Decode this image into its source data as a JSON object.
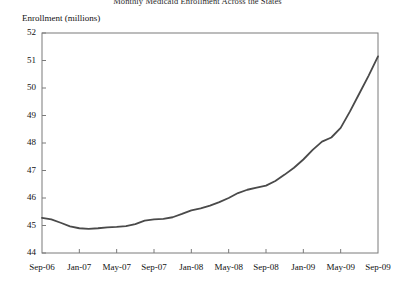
{
  "chart_data": {
    "type": "line",
    "title": "Monthly Medicaid Enrollment Across the States",
    "ylabel": "Enrollment (millions)",
    "xlabel": "",
    "ylim": [
      44,
      52
    ],
    "yticks": [
      44,
      45,
      46,
      47,
      48,
      49,
      50,
      51,
      52
    ],
    "ytick_labels": [
      "44",
      "45",
      "46",
      "47",
      "48",
      "49",
      "50",
      "51",
      "52"
    ],
    "xtick_labels": [
      "Sep-06",
      "Jan-07",
      "May-07",
      "Sep-07",
      "Jan-08",
      "May-08",
      "Sep-08",
      "Jan-09",
      "May-09",
      "Sep-09"
    ],
    "grid": false,
    "legend": "none",
    "line_color": "#4a4a4a",
    "categories": [
      "Sep-06",
      "Oct-06",
      "Nov-06",
      "Dec-06",
      "Jan-07",
      "Feb-07",
      "Mar-07",
      "Apr-07",
      "May-07",
      "Jun-07",
      "Jul-07",
      "Aug-07",
      "Sep-07",
      "Oct-07",
      "Nov-07",
      "Dec-07",
      "Jan-08",
      "Feb-08",
      "Mar-08",
      "Apr-08",
      "May-08",
      "Jun-08",
      "Jul-08",
      "Aug-08",
      "Sep-08",
      "Oct-08",
      "Nov-08",
      "Dec-08",
      "Jan-09",
      "Feb-09",
      "Mar-09",
      "Apr-09",
      "May-09",
      "Jun-09",
      "Jul-09",
      "Aug-09",
      "Sep-09"
    ],
    "values": [
      45.28,
      45.22,
      45.1,
      44.97,
      44.9,
      44.88,
      44.9,
      44.93,
      44.95,
      44.98,
      45.05,
      45.18,
      45.22,
      45.24,
      45.3,
      45.42,
      45.55,
      45.62,
      45.72,
      45.85,
      46.0,
      46.18,
      46.3,
      46.38,
      46.45,
      46.62,
      46.85,
      47.1,
      47.4,
      47.75,
      48.05,
      48.2,
      48.55,
      49.15,
      49.8,
      50.45,
      51.15
    ],
    "series": [
      {
        "name": "Total Medicaid enrollment",
        "values": [
          45.28,
          45.22,
          45.1,
          44.97,
          44.9,
          44.88,
          44.9,
          44.93,
          44.95,
          44.98,
          45.05,
          45.18,
          45.22,
          45.24,
          45.3,
          45.42,
          45.55,
          45.62,
          45.72,
          45.85,
          46.0,
          46.18,
          46.3,
          46.38,
          46.45,
          46.62,
          46.85,
          47.1,
          47.4,
          47.75,
          48.05,
          48.2,
          48.55,
          49.15,
          49.8,
          50.45,
          51.15
        ]
      }
    ]
  }
}
